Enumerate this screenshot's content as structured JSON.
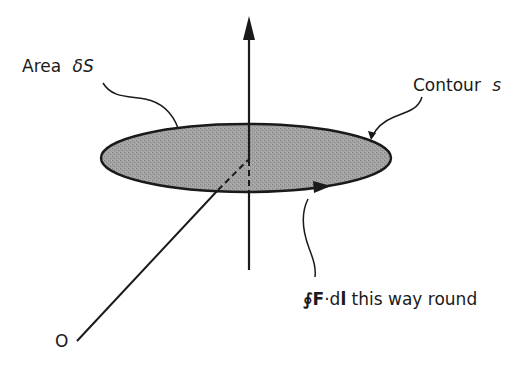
{
  "diagram": {
    "labels": {
      "area": {
        "prefix": "Area",
        "symbol": "δS"
      },
      "contour": {
        "prefix": "Contour",
        "symbol": "s"
      },
      "integral": {
        "oint": "∮",
        "F": "F",
        "dot": "·d",
        "l": "l",
        "suffix": " this way round"
      },
      "origin": "O"
    },
    "elements": {
      "surface": {
        "shape": "ellipse",
        "fill": "#9a9a9a",
        "stroke": "#1a1a1a"
      },
      "normal_axis": {
        "direction": "up",
        "style": "arrow"
      },
      "position_line": {
        "from": "O",
        "to": "center of area"
      },
      "circulation_arrow": {
        "direction": "right (front of contour)"
      }
    },
    "colors": {
      "ink": "#1a1a1a",
      "fill": "#9a9a9a",
      "background": "#ffffff"
    }
  }
}
